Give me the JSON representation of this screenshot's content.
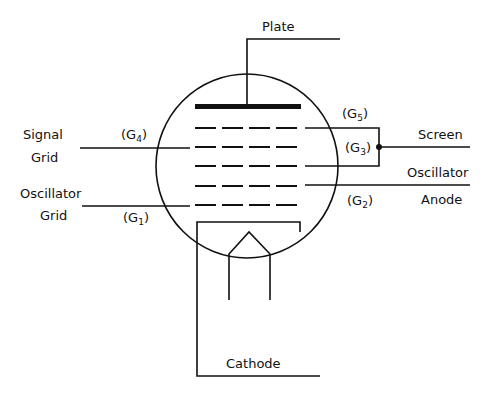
{
  "diagram": {
    "type": "vacuum-tube-schematic",
    "labels": {
      "plate": "Plate",
      "signal_grid_line1": "Signal",
      "signal_grid_line2": "Grid",
      "oscillator_grid_line1": "Oscillator",
      "oscillator_grid_line2": "Grid",
      "screen": "Screen",
      "oscillator_anode_line1": "Oscillator",
      "oscillator_anode_line2": "Anode",
      "cathode": "Cathode"
    },
    "grids": {
      "g1": {
        "prefix": "(G",
        "sub": "1",
        "suffix": ")"
      },
      "g2": {
        "prefix": "(G",
        "sub": "2",
        "suffix": ")"
      },
      "g3": {
        "prefix": "(G",
        "sub": "3",
        "suffix": ")"
      },
      "g4": {
        "prefix": "(G",
        "sub": "4",
        "suffix": ")"
      },
      "g5": {
        "prefix": "(G",
        "sub": "5",
        "suffix": ")"
      }
    },
    "colors": {
      "ink": "#111111",
      "background": "#ffffff"
    }
  }
}
